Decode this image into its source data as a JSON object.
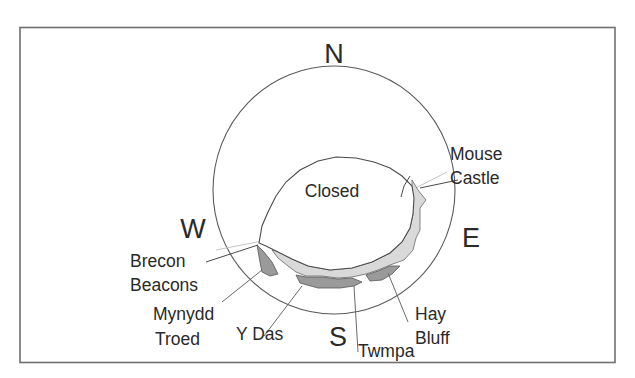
{
  "diagram": {
    "title_text": "",
    "cardinals": {
      "north": "N",
      "south": "S",
      "east": "E",
      "west": "W"
    },
    "center_label": "Closed",
    "sites": [
      {
        "id": "mouse-castle",
        "lines": [
          "Mouse",
          "Castle"
        ]
      },
      {
        "id": "brecon-beacons",
        "lines": [
          "Brecon",
          "Beacons"
        ]
      },
      {
        "id": "mynydd-troed",
        "lines": [
          "Mynydd",
          "Troed"
        ]
      },
      {
        "id": "y-das",
        "lines": [
          "Y Das"
        ]
      },
      {
        "id": "twmpa",
        "lines": [
          "Twmpa"
        ]
      },
      {
        "id": "hay-bluff",
        "lines": [
          "Hay",
          "Bluff"
        ]
      }
    ],
    "colors": {
      "frame": "#6e6e6e",
      "circle": "#5a5a5a",
      "horizon_line": "#c8c8c8",
      "fill_light": "#d9d9d9",
      "fill_dark": "#9a9a9a",
      "text": "#2a2a2a"
    }
  }
}
